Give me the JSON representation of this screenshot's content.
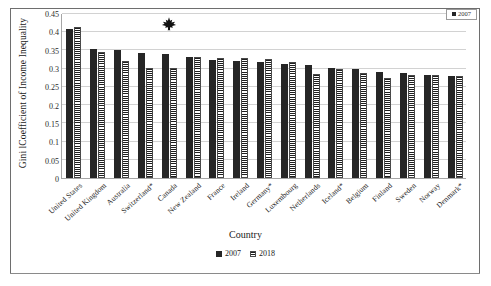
{
  "chart_data": {
    "type": "bar",
    "title": "",
    "xlabel": "Country",
    "ylabel": "Gini lCoefficient of Income Inequality",
    "ylim": [
      0,
      0.45
    ],
    "ytick_labels": [
      "0",
      "0.05",
      "0.1",
      "0.15",
      "0.2",
      "0.25",
      "0.3",
      "0.35",
      "0.4",
      "0.45"
    ],
    "ytick_values": [
      0,
      0.05,
      0.1,
      0.15,
      0.2,
      0.25,
      0.3,
      0.35,
      0.4,
      0.45
    ],
    "grid": true,
    "legend_position": "bottom",
    "categories": [
      "United States",
      "United Kingdom",
      "Australia",
      "Switzerland*",
      "Canada",
      "New Zealand",
      "France",
      "Ireland",
      "Germany*",
      "Luxembourg",
      "Netherlands",
      "Iceland*",
      "Belgium",
      "Finland",
      "Sweden",
      "Norway",
      "Denmark*"
    ],
    "series": [
      {
        "name": "2007",
        "values": [
          0.41,
          0.355,
          0.352,
          0.344,
          0.339,
          0.331,
          0.325,
          0.321,
          0.319,
          0.312,
          0.309,
          0.302,
          0.298,
          0.292,
          0.289,
          0.283,
          0.279
        ]
      },
      {
        "name": "2018",
        "values": [
          0.415,
          0.347,
          0.322,
          0.301,
          0.301,
          0.333,
          0.329,
          0.328,
          0.326,
          0.317,
          0.285,
          0.298,
          0.289,
          0.275,
          0.283,
          0.284,
          0.281
        ]
      }
    ],
    "annotations": [
      {
        "type": "maple-leaf-marker",
        "category": "Canada",
        "value": 0.4
      }
    ]
  },
  "axes": {
    "y_title": "Gini lCoefficient of Income Inequality",
    "x_title": "Country"
  },
  "legend": {
    "items": [
      {
        "label": "2007",
        "color": "#262626",
        "pattern": "solid"
      },
      {
        "label": "2018",
        "color": "#1f1f1f",
        "pattern": "horizontal-stripes"
      }
    ]
  },
  "corner_legend": {
    "label": "2007"
  }
}
